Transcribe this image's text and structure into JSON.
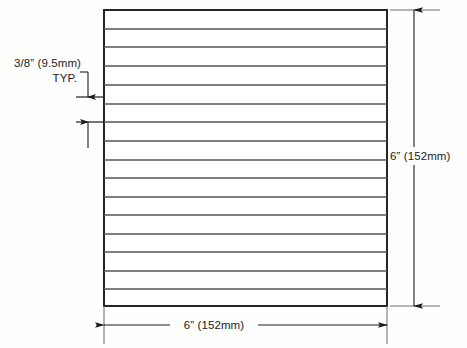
{
  "drawing": {
    "type": "engineering-dimension-drawing",
    "description": "Rectangular panel with evenly spaced horizontal lines, dimensioned on width, height and line spacing",
    "background_color": "#fefefe",
    "line_color": "#1c1c1c",
    "interior_line_color": "#555555",
    "text_color": "#1c1c1c",
    "panel": {
      "name": "ruled-panel",
      "x": 104,
      "y": 10,
      "width": 283,
      "height": 296,
      "interior_line_count": 15,
      "interior_line_ys": [
        29,
        47,
        66,
        85,
        104,
        122,
        141,
        160,
        178,
        197,
        215,
        234,
        252,
        271,
        289
      ]
    },
    "dimensions": {
      "spacing": {
        "name": "line-spacing-dimension",
        "label_line1": "3/8” (9.5mm)",
        "label_line2": "TYP.",
        "label_x": 14,
        "label_y1": 67,
        "label_y2": 82,
        "leader_corner_x": 88,
        "leader_top_y": 72,
        "arrow_upper_target_y": 97,
        "arrow_lower_target_y": 122,
        "extension_left_x": 76
      },
      "height": {
        "name": "overall-height-dimension",
        "label": "6” (152mm)",
        "label_x": 390,
        "label_y": 160,
        "dim_line_x": 414,
        "top_y": 10,
        "bottom_y": 306,
        "extension_top_y": 10,
        "extension_bottom_y": 306,
        "extension_x_start": 390,
        "extension_x_end": 440
      },
      "width": {
        "name": "overall-width-dimension",
        "label": "6” (152mm)",
        "label_x": 214,
        "label_y": 329,
        "dim_line_y": 325,
        "left_x": 104,
        "right_x": 387,
        "extension_y_start": 306,
        "extension_y_end": 344
      }
    }
  }
}
